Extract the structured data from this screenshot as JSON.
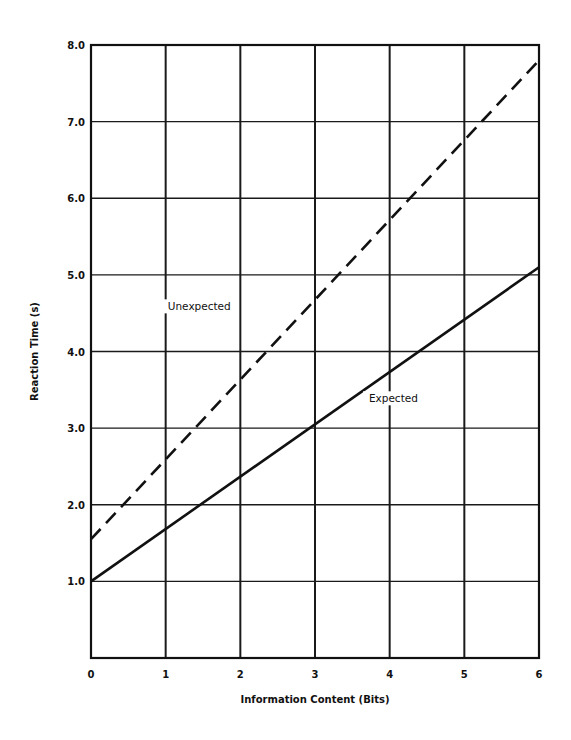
{
  "chart_data": {
    "type": "line",
    "title": "",
    "xlabel": "Information Content (Bits)",
    "ylabel": "Reaction Time (s)",
    "xlim": [
      0,
      6
    ],
    "ylim": [
      0,
      8
    ],
    "grid": true,
    "x_ticks": [
      "0",
      "1",
      "2",
      "3",
      "4",
      "5",
      "6"
    ],
    "x_tick_values": [
      0,
      1,
      2,
      3,
      4,
      5,
      6
    ],
    "y_ticks": [
      "1.0",
      "2.0",
      "3.0",
      "4.0",
      "5.0",
      "6.0",
      "7.0",
      "8.0"
    ],
    "y_tick_values": [
      1,
      2,
      3,
      4,
      5,
      6,
      7,
      8
    ],
    "series": [
      {
        "name": "Unexpected",
        "style": "dashed",
        "x": [
          0,
          6
        ],
        "y": [
          1.55,
          7.8
        ]
      },
      {
        "name": "Expected",
        "style": "solid",
        "x": [
          0,
          6
        ],
        "y": [
          1.0,
          5.1
        ]
      }
    ],
    "annotations": [
      {
        "text": "Unexpected",
        "x": 1.45,
        "y": 4.55
      },
      {
        "text": "Expected",
        "x": 4.05,
        "y": 3.35
      }
    ]
  }
}
